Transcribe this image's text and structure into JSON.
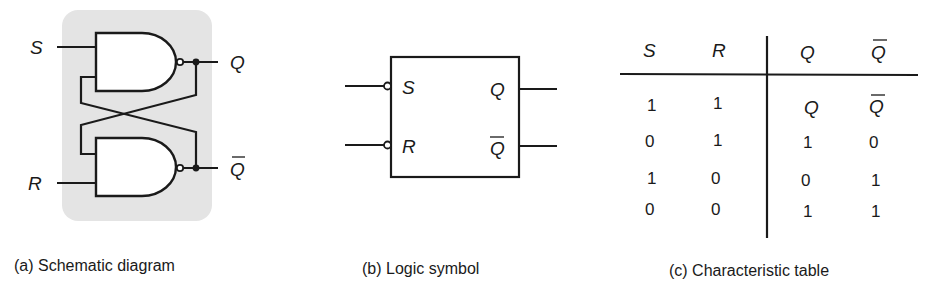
{
  "figure": {
    "panels": [
      {
        "id": "a",
        "caption": "(a) Schematic diagram",
        "inputs": {
          "set": "S",
          "reset": "R"
        },
        "outputs": {
          "q": "Q",
          "q_bar": "Q"
        },
        "panel_color": "#e4e4e4"
      },
      {
        "id": "b",
        "caption": "(b) Logic symbol",
        "inputs": {
          "set": "S",
          "reset": "R"
        },
        "outputs": {
          "q": "Q",
          "q_bar": "Q"
        }
      },
      {
        "id": "c",
        "caption": "(c) Characteristic table",
        "headers": [
          "S",
          "R",
          "Q",
          "Q"
        ],
        "header_overbar": [
          false,
          false,
          false,
          true
        ],
        "rows": [
          {
            "S": "1",
            "R": "1",
            "Q": "Q",
            "Qbar": "Q",
            "q_symbolic": true
          },
          {
            "S": "0",
            "R": "1",
            "Q": "1",
            "Qbar": "0",
            "q_symbolic": false
          },
          {
            "S": "1",
            "R": "0",
            "Q": "0",
            "Qbar": "1",
            "q_symbolic": false
          },
          {
            "S": "0",
            "R": "0",
            "Q": "1",
            "Qbar": "1",
            "q_symbolic": false
          }
        ]
      }
    ]
  }
}
